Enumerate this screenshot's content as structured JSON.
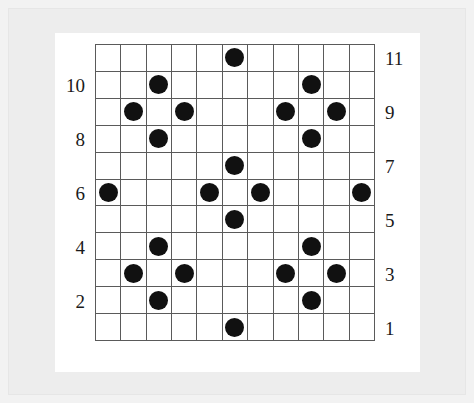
{
  "figure": {
    "type": "grid-lattice-diagram",
    "rows": 11,
    "cols": 11,
    "background_color": "#f2f2f2",
    "panel_color": "#ffffff",
    "frame_color": "#ededed",
    "grid_line_color": "#5a5a5a",
    "dot_color": "#111111"
  },
  "axis": {
    "left_labels": [
      "10",
      "8",
      "6",
      "4",
      "2"
    ],
    "right_labels": [
      "11",
      "9",
      "7",
      "5",
      "3",
      "1"
    ]
  },
  "chart_data": {
    "type": "scatter",
    "title": "",
    "xlabel": "",
    "ylabel": "",
    "grid": true,
    "legend": "none",
    "xlim": [
      1,
      11
    ],
    "ylim": [
      1,
      11
    ],
    "x_tick_labels": [],
    "left_y_tick_labels": [
      "10",
      "8",
      "6",
      "4",
      "2"
    ],
    "right_y_tick_labels": [
      "11",
      "9",
      "7",
      "5",
      "3",
      "1"
    ],
    "marker": "filled-circle",
    "marker_color": "#111111",
    "point_count": 24,
    "points": [
      {
        "col": 6,
        "row": 11
      },
      {
        "col": 3,
        "row": 10
      },
      {
        "col": 9,
        "row": 10
      },
      {
        "col": 2,
        "row": 9
      },
      {
        "col": 4,
        "row": 9
      },
      {
        "col": 8,
        "row": 9
      },
      {
        "col": 10,
        "row": 9
      },
      {
        "col": 3,
        "row": 8
      },
      {
        "col": 9,
        "row": 8
      },
      {
        "col": 6,
        "row": 7
      },
      {
        "col": 1,
        "row": 6
      },
      {
        "col": 5,
        "row": 6
      },
      {
        "col": 7,
        "row": 6
      },
      {
        "col": 11,
        "row": 6
      },
      {
        "col": 6,
        "row": 5
      },
      {
        "col": 3,
        "row": 4
      },
      {
        "col": 9,
        "row": 4
      },
      {
        "col": 2,
        "row": 3
      },
      {
        "col": 4,
        "row": 3
      },
      {
        "col": 8,
        "row": 3
      },
      {
        "col": 10,
        "row": 3
      },
      {
        "col": 3,
        "row": 2
      },
      {
        "col": 9,
        "row": 2
      },
      {
        "col": 6,
        "row": 1
      }
    ]
  }
}
